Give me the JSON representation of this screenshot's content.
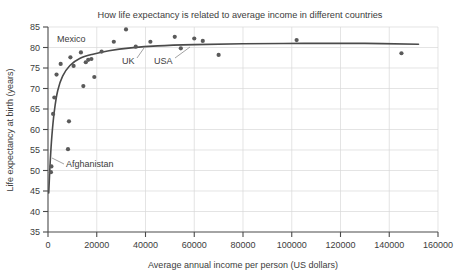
{
  "chart_data": {
    "type": "scatter",
    "title": "How life expectancy is related to average income in different countries",
    "xlabel": "Average annual income per person (US dollars)",
    "ylabel": "Life expectancy at birth (years)",
    "xlim": [
      0,
      160000
    ],
    "ylim": [
      35,
      85
    ],
    "xticks": [
      0,
      20000,
      40000,
      60000,
      80000,
      100000,
      120000,
      140000,
      160000
    ],
    "yticks": [
      35,
      40,
      45,
      50,
      55,
      60,
      65,
      70,
      75,
      80,
      85
    ],
    "xtick_labels": [
      "0",
      "20000",
      "40000",
      "60000",
      "80000",
      "100000",
      "120000",
      "140000",
      "160000"
    ],
    "ytick_labels": [
      "35",
      "40",
      "45",
      "50",
      "55",
      "60",
      "65",
      "70",
      "75",
      "80",
      "85"
    ],
    "grid": true,
    "legend": "none",
    "point_color": "#5a5a5a",
    "curve_color": "#4a4a4a",
    "grid_color": "#d9d9d9",
    "axis_color": "#4a4a4a",
    "points": [
      {
        "x": 1200,
        "y": 49.6
      },
      {
        "x": 1400,
        "y": 51.0
      },
      {
        "x": 2100,
        "y": 63.8
      },
      {
        "x": 2600,
        "y": 67.8
      },
      {
        "x": 3500,
        "y": 73.4
      },
      {
        "x": 5200,
        "y": 76.0
      },
      {
        "x": 8200,
        "y": 55.2
      },
      {
        "x": 8600,
        "y": 62.0
      },
      {
        "x": 9200,
        "y": 77.6
      },
      {
        "x": 10500,
        "y": 75.5
      },
      {
        "x": 13500,
        "y": 78.8
      },
      {
        "x": 14500,
        "y": 70.6
      },
      {
        "x": 15500,
        "y": 76.4
      },
      {
        "x": 16500,
        "y": 77.0
      },
      {
        "x": 17800,
        "y": 77.2
      },
      {
        "x": 19000,
        "y": 72.8
      },
      {
        "x": 22000,
        "y": 79.0
      },
      {
        "x": 27000,
        "y": 81.4
      },
      {
        "x": 32000,
        "y": 84.4
      },
      {
        "x": 36000,
        "y": 80.2
      },
      {
        "x": 42000,
        "y": 81.4
      },
      {
        "x": 52000,
        "y": 82.6
      },
      {
        "x": 54500,
        "y": 79.8
      },
      {
        "x": 60000,
        "y": 82.2
      },
      {
        "x": 63500,
        "y": 81.6
      },
      {
        "x": 70000,
        "y": 78.2
      },
      {
        "x": 102000,
        "y": 81.8
      },
      {
        "x": 145000,
        "y": 78.6
      }
    ],
    "trend_points": [
      {
        "x": 300,
        "y": 44.5
      },
      {
        "x": 900,
        "y": 52.0
      },
      {
        "x": 1600,
        "y": 58.5
      },
      {
        "x": 2600,
        "y": 64.5
      },
      {
        "x": 4000,
        "y": 69.5
      },
      {
        "x": 6000,
        "y": 73.0
      },
      {
        "x": 9000,
        "y": 75.6
      },
      {
        "x": 13000,
        "y": 77.3
      },
      {
        "x": 18000,
        "y": 78.3
      },
      {
        "x": 25000,
        "y": 79.2
      },
      {
        "x": 34000,
        "y": 79.9
      },
      {
        "x": 45000,
        "y": 80.4
      },
      {
        "x": 60000,
        "y": 80.7
      },
      {
        "x": 80000,
        "y": 80.9
      },
      {
        "x": 105000,
        "y": 81.0
      },
      {
        "x": 130000,
        "y": 81.0
      },
      {
        "x": 152000,
        "y": 80.8
      }
    ],
    "annotations": [
      {
        "name": "mexico",
        "label": "Mexico",
        "label_x": 57,
        "label_y": 42
      },
      {
        "name": "uk",
        "label": "UK",
        "label_x": 122,
        "label_y": 64
      },
      {
        "name": "usa",
        "label": "USA",
        "label_x": 154,
        "label_y": 64
      },
      {
        "name": "afghanistan",
        "label": "Afghanistan",
        "label_x": 66,
        "label_y": 167
      }
    ],
    "leader_lines": [
      {
        "name": "uk-leader",
        "x1": 137,
        "y1": 58,
        "x2": 144,
        "y2": 48
      },
      {
        "name": "usa-leader",
        "x1": 175,
        "y1": 58,
        "x2": 190,
        "y2": 47
      },
      {
        "name": "afghanistan-leader",
        "x1": 64,
        "y1": 164,
        "x2": 52,
        "y2": 158
      }
    ]
  }
}
